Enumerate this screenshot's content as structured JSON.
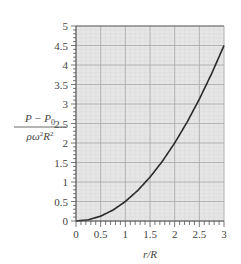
{
  "chart_data": {
    "type": "line",
    "title": "",
    "xlabel": "r/R",
    "ylabel": {
      "numerator": "P − P",
      "numerator_sub": "0",
      "denominator": "ρω",
      "denominator_sup": "2",
      "denominator_rest": "R",
      "denominator_rest_sup": "2"
    },
    "xlim": [
      0,
      3
    ],
    "ylim": [
      0,
      5
    ],
    "xticks": [
      "0",
      "0.5",
      "1",
      "1.5",
      "2",
      "2.5",
      "3"
    ],
    "yticks": [
      "0",
      "0.5",
      "1",
      "1.5",
      "2",
      "2.5",
      "3",
      "3.5",
      "4",
      "4.5",
      "5"
    ],
    "grid": true,
    "legend": null,
    "series": [
      {
        "name": "(P − P0)/(ρω²R²) = ½(r/R)²",
        "x": [
          0,
          0.25,
          0.5,
          0.75,
          1,
          1.25,
          1.5,
          1.75,
          2,
          2.25,
          2.5,
          2.75,
          3
        ],
        "values": [
          0,
          0.03,
          0.125,
          0.28,
          0.5,
          0.78,
          1.125,
          1.53,
          2.0,
          2.53,
          3.125,
          3.78,
          4.5
        ]
      }
    ],
    "colors": {
      "plot_bg": "#e6e6e6",
      "grid_major": "#a8a8a8",
      "grid_minor": "#d6d6d6",
      "curve": "#2a2a2a",
      "axis": "#555555"
    }
  }
}
